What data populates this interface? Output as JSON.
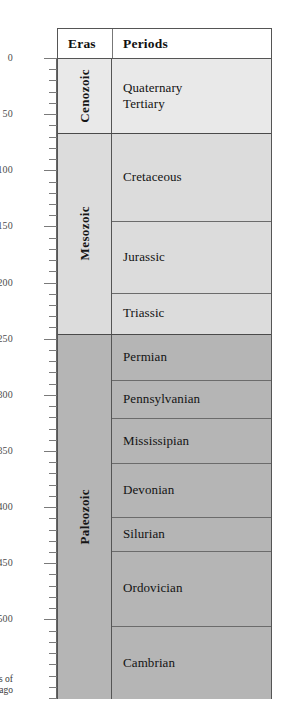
{
  "chart_data": {
    "type": "table",
    "ylabel": "Millions of years ago",
    "ylim": [
      0,
      570
    ],
    "y_axis_inverted": true,
    "grid": false,
    "major_ticks": [
      0,
      50,
      100,
      150,
      200,
      250,
      300,
      350,
      400,
      450,
      500
    ],
    "minor_tick_interval": 10,
    "columns": [
      "Eras",
      "Periods"
    ],
    "eras": [
      {
        "name": "Cenozoic",
        "start_mya": 0,
        "end_mya": 66,
        "color": "#e9e9e9",
        "periods": [
          {
            "name": "Quaternary",
            "start_mya": 0,
            "end_mya": 2
          },
          {
            "name": "Tertiary",
            "start_mya": 2,
            "end_mya": 66
          }
        ]
      },
      {
        "name": "Mesozoic",
        "start_mya": 66,
        "end_mya": 245,
        "color": "#dcdcdc",
        "periods": [
          {
            "name": "Cretaceous",
            "start_mya": 66,
            "end_mya": 144
          },
          {
            "name": "Jurassic",
            "start_mya": 144,
            "end_mya": 208
          },
          {
            "name": "Triassic",
            "start_mya": 208,
            "end_mya": 245
          }
        ]
      },
      {
        "name": "Paleozoic",
        "start_mya": 245,
        "end_mya": 570,
        "color": "#b5b5b5",
        "periods": [
          {
            "name": "Permian",
            "start_mya": 245,
            "end_mya": 286
          },
          {
            "name": "Pennsylvanian",
            "start_mya": 286,
            "end_mya": 320
          },
          {
            "name": "Mississipian",
            "start_mya": 320,
            "end_mya": 360
          },
          {
            "name": "Devonian",
            "start_mya": 360,
            "end_mya": 408
          },
          {
            "name": "Silurian",
            "start_mya": 408,
            "end_mya": 438
          },
          {
            "name": "Ordovician",
            "start_mya": 438,
            "end_mya": 505
          },
          {
            "name": "Cambrian",
            "start_mya": 505,
            "end_mya": 570
          }
        ]
      }
    ]
  },
  "axis": {
    "caption_line1": "Millions of",
    "caption_line2": "years ago",
    "tick_labels": [
      "0",
      "50",
      "100",
      "150",
      "200",
      "250",
      "300",
      "350",
      "400",
      "450",
      "500"
    ]
  },
  "header": {
    "eras": "Eras",
    "periods": "Periods"
  }
}
